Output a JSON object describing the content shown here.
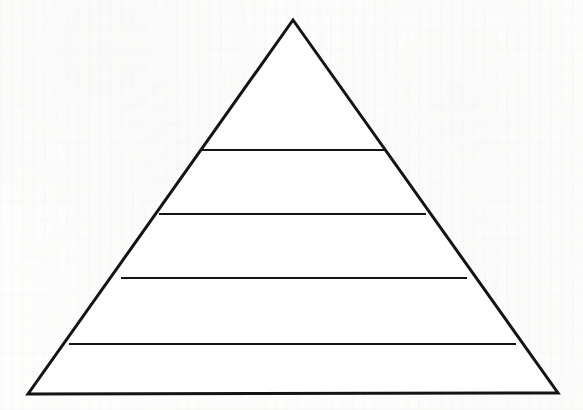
{
  "figure": {
    "type": "pyramid-diagram",
    "title": "",
    "caption": "",
    "background_color": "#fdfdfc",
    "stroke_color": "#141414",
    "fill_color": "#ffffff",
    "outline_stroke_width": 3,
    "divider_stroke_width": 2,
    "level_count": 5,
    "labels": []
  },
  "chart_data": {
    "type": "pyramid",
    "title": "",
    "xlabel": "",
    "ylabel": "",
    "categories": [
      "Level 1",
      "Level 2",
      "Level 3",
      "Level 4",
      "Level 5"
    ],
    "values": [
      1,
      2,
      3,
      4,
      5
    ],
    "legend": [],
    "annotations": [],
    "grid": false,
    "geometry": {
      "canvas_width": 583,
      "canvas_height": 410,
      "apex": {
        "x": 293,
        "y": 20
      },
      "bottom_left": {
        "x": 28,
        "y": 394
      },
      "bottom_right": {
        "x": 558,
        "y": 393
      },
      "dividers": [
        {
          "index": 1,
          "y": 150,
          "x1": 203,
          "x2": 384
        },
        {
          "index": 2,
          "y": 214,
          "x1": 160,
          "x2": 425
        },
        {
          "index": 3,
          "y": 278,
          "x1": 122,
          "x2": 466
        },
        {
          "index": 4,
          "y": 344,
          "x1": 70,
          "x2": 515
        }
      ],
      "bands": [
        {
          "name": "band-apex",
          "top_y": 20,
          "bottom_y": 150
        },
        {
          "name": "band-second",
          "top_y": 150,
          "bottom_y": 214
        },
        {
          "name": "band-third",
          "top_y": 214,
          "bottom_y": 278
        },
        {
          "name": "band-fourth",
          "top_y": 278,
          "bottom_y": 344
        },
        {
          "name": "band-base",
          "top_y": 344,
          "bottom_y": 394
        }
      ]
    }
  },
  "accessibility": {
    "alt_text": "Outline drawing of a triangle divided by four horizontal lines into five horizontal bands, forming a blank five-level pyramid diagram."
  }
}
